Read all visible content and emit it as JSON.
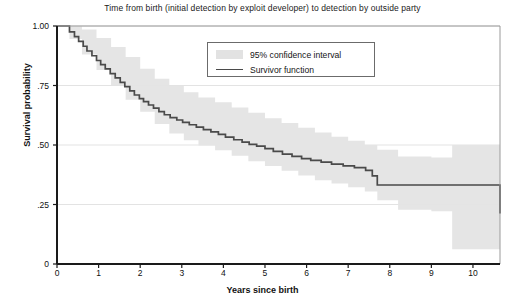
{
  "chart_data": {
    "type": "line",
    "title": "Time from birth (initial detection by exploit developer) to detection by outside party",
    "xlabel": "Years since birth",
    "ylabel": "Survival probability",
    "xlim": [
      0,
      10.65
    ],
    "ylim": [
      0,
      1.0
    ],
    "xticks": [
      0,
      1,
      2,
      3,
      4,
      5,
      6,
      7,
      8,
      9,
      10
    ],
    "xtick_labels": [
      "0",
      "1",
      "2",
      "3",
      "4",
      "5",
      "6",
      "7",
      "8",
      "9",
      "10"
    ],
    "yticks": [
      0,
      0.25,
      0.5,
      0.75,
      1.0
    ],
    "ytick_labels": [
      "0",
      ".25",
      ".50",
      ".75",
      "1.00"
    ],
    "grid": "horizontal",
    "legend_position": "top-center",
    "legend": [
      {
        "label": "95% confidence interval",
        "type": "band",
        "color": "#e2e2e2"
      },
      {
        "label": "Survivor function",
        "type": "line",
        "color": "#4a4a4a"
      }
    ],
    "series": [
      {
        "name": "Survivor function",
        "step": "post",
        "color": "#4a4a4a",
        "x": [
          0.0,
          0.18,
          0.3,
          0.42,
          0.52,
          0.63,
          0.72,
          0.84,
          0.95,
          1.05,
          1.16,
          1.28,
          1.4,
          1.52,
          1.63,
          1.75,
          1.86,
          1.98,
          2.08,
          2.2,
          2.32,
          2.45,
          2.58,
          2.72,
          2.88,
          3.02,
          3.18,
          3.35,
          3.52,
          3.7,
          3.88,
          4.05,
          4.25,
          4.45,
          4.62,
          4.8,
          5.0,
          5.2,
          5.42,
          5.65,
          5.88,
          6.1,
          6.35,
          6.6,
          6.88,
          7.15,
          7.42,
          7.58,
          7.7,
          9.5,
          10.65
        ],
        "y": [
          1.0,
          1.0,
          0.975,
          0.955,
          0.935,
          0.915,
          0.895,
          0.875,
          0.855,
          0.838,
          0.82,
          0.8,
          0.782,
          0.763,
          0.745,
          0.727,
          0.71,
          0.695,
          0.682,
          0.668,
          0.655,
          0.64,
          0.627,
          0.615,
          0.605,
          0.595,
          0.585,
          0.575,
          0.565,
          0.555,
          0.545,
          0.533,
          0.522,
          0.512,
          0.503,
          0.495,
          0.485,
          0.473,
          0.462,
          0.452,
          0.443,
          0.435,
          0.428,
          0.42,
          0.412,
          0.405,
          0.393,
          0.37,
          0.332,
          0.332,
          0.212
        ]
      }
    ],
    "confidence_band": {
      "name": "95% confidence interval",
      "color": "#e2e2e2",
      "x": [
        0.0,
        0.3,
        0.6,
        0.95,
        1.3,
        1.65,
        2.0,
        2.35,
        2.7,
        3.05,
        3.4,
        3.8,
        4.2,
        4.6,
        5.0,
        5.4,
        5.8,
        6.2,
        6.6,
        7.0,
        7.4,
        7.7,
        8.2,
        9.0,
        9.5,
        10.65
      ],
      "lower": [
        1.0,
        0.945,
        0.88,
        0.815,
        0.75,
        0.69,
        0.64,
        0.588,
        0.548,
        0.52,
        0.498,
        0.478,
        0.455,
        0.432,
        0.412,
        0.392,
        0.372,
        0.352,
        0.338,
        0.322,
        0.305,
        0.268,
        0.228,
        0.222,
        0.062,
        0.062
      ],
      "upper": [
        1.0,
        1.0,
        0.985,
        0.95,
        0.912,
        0.87,
        0.82,
        0.778,
        0.748,
        0.722,
        0.7,
        0.68,
        0.658,
        0.635,
        0.612,
        0.592,
        0.572,
        0.552,
        0.535,
        0.518,
        0.5,
        0.48,
        0.452,
        0.448,
        0.5,
        0.5
      ]
    }
  }
}
